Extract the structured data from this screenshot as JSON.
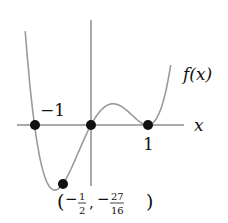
{
  "figure": {
    "function_label": "f(x)",
    "x_axis_label": "x",
    "labels": {
      "neg_one": "−1",
      "pos_one": "1",
      "min_point": {
        "open": "(",
        "minus1": "−",
        "frac1_num": "1",
        "frac1_den": "2",
        "comma": ",",
        "minus2": "−",
        "frac2_num": "27",
        "frac2_den": "16",
        "close": ")"
      }
    },
    "colors": {
      "curve": "#9a9a9a",
      "axes": "#555555",
      "points": "#111111",
      "text": "#111111"
    }
  },
  "chart_data": {
    "type": "line",
    "title": "",
    "function": "f(x) = 3x(x+1)(x-1)^2",
    "xlabel": "x",
    "ylabel": "f(x)",
    "marked_points": [
      {
        "x": -1,
        "y": 0,
        "label": "-1"
      },
      {
        "x": 0,
        "y": 0,
        "label": ""
      },
      {
        "x": 1,
        "y": 0,
        "label": "1"
      },
      {
        "x": -0.5,
        "y": -1.6875,
        "label": "(-1/2, -27/16)"
      }
    ],
    "grid": false
  }
}
